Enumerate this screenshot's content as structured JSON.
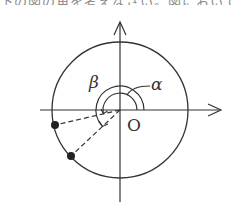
{
  "header": {
    "cutoff_text": "下の図の角を考えなさい。図において"
  },
  "diagram": {
    "type": "unit-circle-angles",
    "origin_label": "O",
    "angle_labels": {
      "alpha": "α",
      "beta": "β"
    },
    "colors": {
      "stroke": "#333333",
      "point": "#222222",
      "background": "#ffffff"
    },
    "geometry": {
      "center": [
        120,
        110
      ],
      "radius": 68,
      "alpha_arc_radius": 17,
      "beta_arc_radius": 24,
      "points": [
        {
          "name": "point-1",
          "x": 55,
          "y": 125
        },
        {
          "name": "point-2",
          "x": 71,
          "y": 156
        }
      ]
    }
  }
}
